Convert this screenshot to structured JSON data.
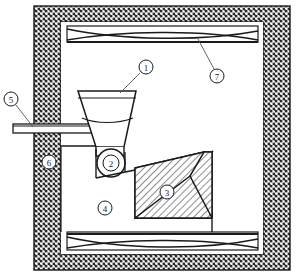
{
  "figure": {
    "type": "engineering-cross-section",
    "width": 296,
    "height": 276,
    "background_color": "#ffffff",
    "line_color": "#1a1a1a",
    "hatch_color": "#2b2b2b"
  },
  "callouts": [
    {
      "id": "callout-1",
      "label": "1",
      "target": "hopper",
      "description": "Charging hopper / funnel with material level line",
      "circle": {
        "cx": 146,
        "cy": 67,
        "r": 7
      },
      "leader": {
        "x1": 140,
        "y1": 73,
        "x2": 120,
        "y2": 93
      }
    },
    {
      "id": "callout-2",
      "label": "2",
      "target": "roller",
      "description": "Feed roller beneath hopper outlet",
      "circle": {
        "cx": 111,
        "cy": 163,
        "r": 8
      },
      "leader": null
    },
    {
      "id": "callout-3",
      "label": "3",
      "target": "charge-wedge",
      "description": "Hatched charge / refractory wedge body",
      "circle": {
        "cx": 167,
        "cy": 192,
        "r": 7
      },
      "leader": null
    },
    {
      "id": "callout-4",
      "label": "4",
      "target": "chamber-void",
      "description": "Open chamber interior void",
      "circle": {
        "cx": 105,
        "cy": 208,
        "r": 7
      },
      "leader": null
    },
    {
      "id": "callout-5",
      "label": "5",
      "target": "feed-chute",
      "description": "External feed chute passing through wall",
      "circle": {
        "cx": 11,
        "cy": 99,
        "r": 7
      },
      "leader": {
        "x1": 16,
        "y1": 105,
        "x2": 33,
        "y2": 127
      }
    },
    {
      "id": "callout-6",
      "label": "6",
      "target": "outer-wall",
      "description": "Hatched outer wall / insulation lining",
      "circle": {
        "cx": 49,
        "cy": 162,
        "r": 7
      },
      "leader": null
    },
    {
      "id": "callout-7",
      "label": "7",
      "target": "top-truss-beam",
      "description": "Upper cross-braced truss beam",
      "circle": {
        "cx": 217,
        "cy": 76,
        "r": 7
      },
      "leader": {
        "x1": 214,
        "y1": 69,
        "x2": 198,
        "y2": 39
      }
    }
  ],
  "components": {
    "outer_frame": {
      "name": "outer-wall",
      "label": "6",
      "outer": {
        "x": 34,
        "y": 6,
        "w": 256,
        "h": 264
      },
      "inner": {
        "x": 61,
        "y": 22,
        "w": 202,
        "h": 232
      },
      "fill_pattern": "dense-crosshatch"
    },
    "top_beam": {
      "name": "top-truss-beam",
      "label": "7",
      "rect": {
        "x": 67,
        "y": 26,
        "w": 191,
        "h": 16
      }
    },
    "bottom_beam": {
      "name": "bottom-truss-beam",
      "rect": {
        "x": 67,
        "y": 232,
        "w": 191,
        "h": 18
      }
    },
    "hopper": {
      "name": "hopper",
      "label": "1",
      "top_y": 91,
      "bottom_y": 147,
      "top_left_x": 78,
      "top_right_x": 136,
      "bottom_left_x": 96,
      "bottom_right_x": 124,
      "rim_y": 98,
      "level_y": 118
    },
    "feed_chute": {
      "name": "feed-chute",
      "label": "5",
      "rect": {
        "x": 13,
        "y": 124,
        "w": 86,
        "h": 9
      }
    },
    "roller": {
      "name": "roller",
      "label": "2",
      "cx": 111,
      "cy": 163,
      "r": 14
    },
    "charge_wedge": {
      "name": "charge-wedge",
      "label": "3",
      "points": "135,168 204,152 204,190 190,176 135,218 212,218 212,152",
      "fill_pattern": "diagonal-hatch"
    },
    "chamber_void": {
      "name": "chamber-void",
      "label": "4"
    }
  }
}
